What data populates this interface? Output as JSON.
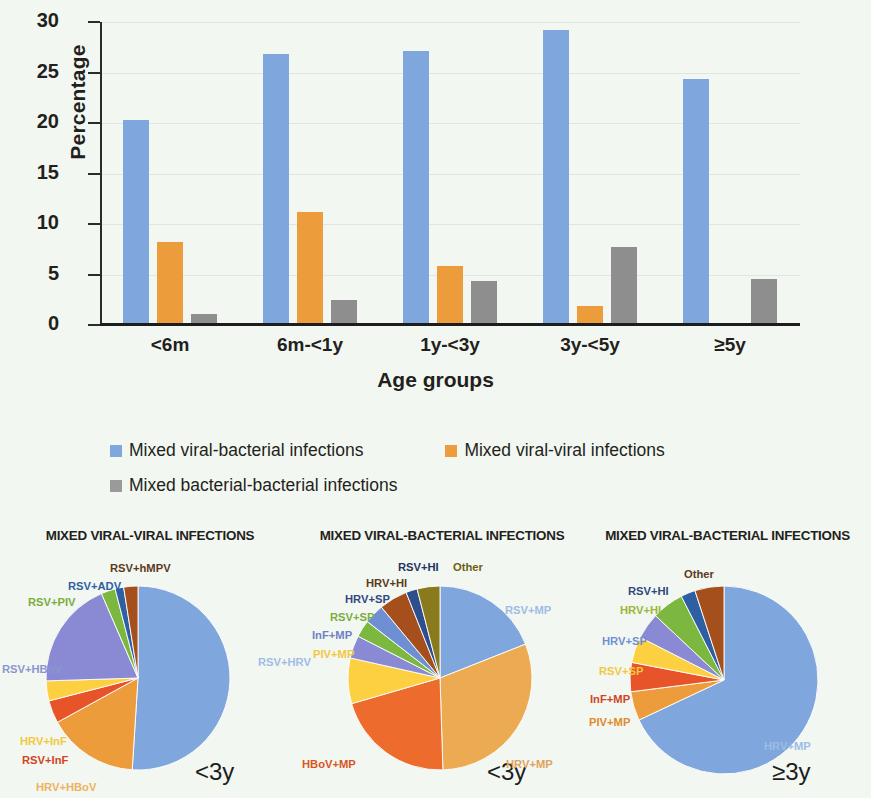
{
  "chart_data": [
    {
      "type": "bar",
      "title": "",
      "xlabel": "Age groups",
      "ylabel": "Percentage",
      "ylim": [
        0,
        30
      ],
      "yticks": [
        0,
        5,
        10,
        15,
        20,
        25,
        30
      ],
      "grid": true,
      "legend_position": "below",
      "categories": [
        "<6m",
        "6m-<1y",
        "1y-<3y",
        "3y-<5y",
        "≥5y"
      ],
      "series": [
        {
          "name": "Mixed viral-bacterial infections",
          "color": "#7fa7dd",
          "values": [
            20.3,
            26.8,
            27.1,
            29.2,
            24.4
          ]
        },
        {
          "name": "Mixed viral-viral infections",
          "color": "#ed9c3c",
          "values": [
            8.2,
            11.2,
            5.8,
            1.9,
            0
          ]
        },
        {
          "name": "Mixed bacterial-bacterial infections",
          "color": "#8e8e8e",
          "values": [
            1.1,
            2.5,
            4.4,
            7.7,
            4.6
          ]
        }
      ]
    },
    {
      "type": "pie",
      "title": "MIXED VIRAL-VIRAL INFECTIONS",
      "age_group": "<3y",
      "labels": [
        "RSV+HRV",
        "HRV+HBoV",
        "RSV+InF",
        "HRV+InF",
        "RSV+HBoV",
        "RSV+PIV",
        "RSV+ADV",
        "RSV+hMPV"
      ],
      "values": [
        51.0,
        16.0,
        4.0,
        3.5,
        19.0,
        2.5,
        1.5,
        2.5
      ],
      "colors": [
        "#7fa7dd",
        "#ed9c3c",
        "#e8542a",
        "#fcd041",
        "#8a8ad4",
        "#7cb83f",
        "#2e5fa3",
        "#a5501c"
      ]
    },
    {
      "type": "pie",
      "title": "MIXED VIRAL-BACTERIAL INFECTIONS",
      "age_group": "<3y",
      "labels": [
        "RSV+MP",
        "HRV+MP",
        "HBoV+MP",
        "PIV+MP",
        "InF+MP",
        "RSV+SP",
        "HRV+SP",
        "HRV+HI",
        "RSV+HI",
        "Other"
      ],
      "values": [
        19.0,
        30.5,
        21.0,
        8.0,
        4.0,
        3.0,
        3.5,
        5.0,
        2.0,
        4.0
      ],
      "colors": [
        "#7fa7dd",
        "#ecab52",
        "#ec6b2d",
        "#fcd041",
        "#8a8ad4",
        "#7cb83f",
        "#6f8fd4",
        "#a5501c",
        "#2e4f8f",
        "#8a7a1e"
      ]
    },
    {
      "type": "pie",
      "title": "MIXED VIRAL-BACTERIAL INFECTIONS",
      "age_group": "≥3y",
      "labels": [
        "HRV+MP",
        "PIV+MP",
        "InF+MP",
        "RSV+SP",
        "HRV+SP",
        "HRV+HI",
        "RSV+HI",
        "Other"
      ],
      "values": [
        68.0,
        5.0,
        5.0,
        4.5,
        4.5,
        5.5,
        2.5,
        5.0
      ],
      "colors": [
        "#7fa7dd",
        "#ed9c3c",
        "#e8542a",
        "#fcd041",
        "#8a8ad4",
        "#7cb83f",
        "#2e5fa3",
        "#a5501c"
      ]
    }
  ],
  "bar_chart": {
    "ylabel": "Percentage",
    "xlabel": "Age groups",
    "yticks": [
      "0",
      "5",
      "10",
      "15",
      "20",
      "25",
      "30"
    ],
    "categories": [
      "<6m",
      "6m-<1y",
      "1y-<3y",
      "3y-<5y",
      "≥5y"
    ]
  },
  "legend": {
    "items": [
      {
        "label": "Mixed viral-bacterial infections",
        "color": "#7fa7dd"
      },
      {
        "label": "Mixed viral-viral infections",
        "color": "#ed9c3c"
      },
      {
        "label": "Mixed bacterial-bacterial infections",
        "color": "#9a9a9a"
      }
    ]
  },
  "pies": {
    "p0": {
      "title": "MIXED VIRAL-VIRAL INFECTIONS",
      "age": "<3y"
    },
    "p1": {
      "title": "MIXED VIRAL-BACTERIAL INFECTIONS",
      "age": "<3y"
    },
    "p2": {
      "title": "MIXED VIRAL-BACTERIAL INFECTIONS",
      "age": "≥3y"
    }
  },
  "pie_label_layout": [
    [
      {
        "text": "RSV+HRV",
        "color": "#9dbde6",
        "x": 258,
        "y": 128,
        "anchor": "start"
      },
      {
        "text": "HRV+HBoV",
        "color": "#edb25f",
        "x": 36,
        "y": 253,
        "anchor": "start"
      },
      {
        "text": "RSV+InF",
        "color": "#d0451f",
        "x": 22,
        "y": 226,
        "anchor": "start"
      },
      {
        "text": "HRV+InF",
        "color": "#f2c83f",
        "x": 20,
        "y": 207,
        "anchor": "start"
      },
      {
        "text": "RSV+HBoV",
        "color": "#8a96cf",
        "x": 2,
        "y": 135,
        "anchor": "start"
      },
      {
        "text": "RSV+PIV",
        "color": "#79ad3d",
        "x": 28,
        "y": 68,
        "anchor": "start"
      },
      {
        "text": "RSV+ADV",
        "color": "#2e5fa3",
        "x": 68,
        "y": 52,
        "anchor": "start"
      },
      {
        "text": "RSV+hMPV",
        "color": "#5a3a1c",
        "x": 110,
        "y": 34,
        "anchor": "start"
      }
    ],
    [
      {
        "text": "RSV+MP",
        "color": "#9dbde6",
        "x": 213,
        "y": 76,
        "anchor": "start"
      },
      {
        "text": "HRV+MP",
        "color": "#e0a25b",
        "x": 214,
        "y": 230,
        "anchor": "start"
      },
      {
        "text": "HBoV+MP",
        "color": "#d8551f",
        "x": 10,
        "y": 230,
        "anchor": "start"
      },
      {
        "text": "PIV+MP",
        "color": "#f2c83f",
        "x": 21,
        "y": 120,
        "anchor": "start"
      },
      {
        "text": "InF+MP",
        "color": "#6f7fc4",
        "x": 20,
        "y": 101,
        "anchor": "start"
      },
      {
        "text": "RSV+SP",
        "color": "#79ad3d",
        "x": 38,
        "y": 83,
        "anchor": "start"
      },
      {
        "text": "HRV+SP",
        "color": "#31487f",
        "x": 53,
        "y": 65,
        "anchor": "start"
      },
      {
        "text": "HRV+HI",
        "color": "#5a3a1c",
        "x": 74,
        "y": 49,
        "anchor": "start"
      },
      {
        "text": "RSV+HI",
        "color": "#1f3460",
        "x": 106,
        "y": 33,
        "anchor": "start"
      },
      {
        "text": "Other",
        "color": "#6d5f12",
        "x": 161,
        "y": 33,
        "anchor": "start"
      }
    ],
    [
      {
        "text": "HRV+MP",
        "color": "#9dbde6",
        "x": 180,
        "y": 212,
        "anchor": "start"
      },
      {
        "text": "PIV+MP",
        "color": "#e08a2a",
        "x": 5,
        "y": 188,
        "anchor": "start"
      },
      {
        "text": "InF+MP",
        "color": "#d0451f",
        "x": 6,
        "y": 165,
        "anchor": "start"
      },
      {
        "text": "RSV+SP",
        "color": "#f2c83f",
        "x": 15,
        "y": 137,
        "anchor": "start"
      },
      {
        "text": "HRV+SP",
        "color": "#6f8fd4",
        "x": 18,
        "y": 107,
        "anchor": "start"
      },
      {
        "text": "HRV+HI",
        "color": "#9ab63a",
        "x": 36,
        "y": 76,
        "anchor": "start"
      },
      {
        "text": "RSV+HI",
        "color": "#31487f",
        "x": 44,
        "y": 57,
        "anchor": "start"
      },
      {
        "text": "Other",
        "color": "#5a3a1c",
        "x": 100,
        "y": 40,
        "anchor": "start"
      }
    ]
  ]
}
